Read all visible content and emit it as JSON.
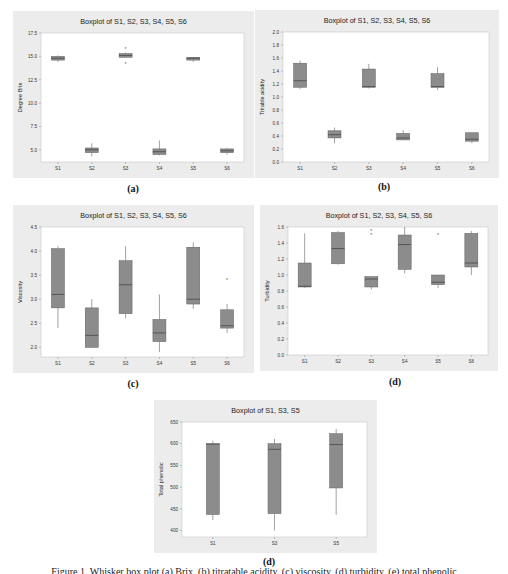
{
  "colors": {
    "frame_bg": "#ececec",
    "plot_bg": "#ffffff",
    "box_fill": "#8c8c8c",
    "box_stroke": "#5f5f5f",
    "axis": "#9a9a9a",
    "text": "#333333"
  },
  "caption": "Figure 1. Whisker box plot (a) Brix, (b) titratable acidity, (c) viscosity, (d) turbidity, (e) total phenolic",
  "chart_data": [
    {
      "id": "a",
      "sublabel": "(a)",
      "type": "box",
      "title": "Boxplot of S1, S2, S3, S4, S5, S6",
      "xlabel": "",
      "ylabel": "Degree Brix",
      "ylim": [
        3.7,
        17.5
      ],
      "yticks": [
        5.0,
        7.5,
        10.0,
        12.5,
        15.0,
        17.5
      ],
      "ytick_labels": [
        "5.0",
        "7.5",
        "10.0",
        "12.5",
        "15.0",
        "17.5"
      ],
      "categories": [
        "S1",
        "S2",
        "S3",
        "S4",
        "S5",
        "S6"
      ],
      "boxes": [
        {
          "min": 14.4,
          "q1": 14.6,
          "median": 14.8,
          "q3": 15.0,
          "max": 15.1,
          "outliers": []
        },
        {
          "min": 4.3,
          "q1": 4.7,
          "median": 5.0,
          "q3": 5.2,
          "max": 5.7,
          "outliers": []
        },
        {
          "min": 14.9,
          "q1": 14.9,
          "median": 15.1,
          "q3": 15.3,
          "max": 15.4,
          "outliers": [
            15.8,
            14.2
          ]
        },
        {
          "min": 4.4,
          "q1": 4.5,
          "median": 4.8,
          "q3": 5.1,
          "max": 6.0,
          "outliers": []
        },
        {
          "min": 14.4,
          "q1": 14.6,
          "median": 14.8,
          "q3": 14.9,
          "max": 14.9,
          "outliers": []
        },
        {
          "min": 4.5,
          "q1": 4.7,
          "median": 4.9,
          "q3": 5.1,
          "max": 5.2,
          "outliers": []
        }
      ]
    },
    {
      "id": "b",
      "sublabel": "(b)",
      "type": "box",
      "title": "Boxplot of S1, S2, S3, S4, S5, S6",
      "xlabel": "",
      "ylabel": "Titrable acidity",
      "ylim": [
        0.0,
        2.0
      ],
      "yticks": [
        0.0,
        0.2,
        0.4,
        0.6,
        0.8,
        1.0,
        1.2,
        1.4,
        1.6,
        1.8,
        2.0
      ],
      "ytick_labels": [
        "0.0",
        "0.2",
        "0.4",
        "0.6",
        "0.8",
        "1.0",
        "1.2",
        "1.4",
        "1.6",
        "1.8",
        "2.0"
      ],
      "categories": [
        "S1",
        "S2",
        "S3",
        "S4",
        "S5",
        "S6"
      ],
      "boxes": [
        {
          "min": 1.12,
          "q1": 1.15,
          "median": 1.25,
          "q3": 1.52,
          "max": 1.56,
          "outliers": []
        },
        {
          "min": 0.29,
          "q1": 0.37,
          "median": 0.42,
          "q3": 0.48,
          "max": 0.53,
          "outliers": []
        },
        {
          "min": 1.13,
          "q1": 1.15,
          "median": 1.16,
          "q3": 1.43,
          "max": 1.51,
          "outliers": []
        },
        {
          "min": 0.34,
          "q1": 0.34,
          "median": 0.37,
          "q3": 0.44,
          "max": 0.49,
          "outliers": []
        },
        {
          "min": 1.11,
          "q1": 1.15,
          "median": 1.16,
          "q3": 1.36,
          "max": 1.46,
          "outliers": []
        },
        {
          "min": 0.29,
          "q1": 0.32,
          "median": 0.35,
          "q3": 0.45,
          "max": 0.45,
          "outliers": []
        }
      ]
    },
    {
      "id": "c",
      "sublabel": "(c)",
      "type": "box",
      "title": "Boxplot of S1, S2, S3, S4, S5, S6",
      "xlabel": "",
      "ylabel": "Viscosity",
      "ylim": [
        1.8,
        4.5
      ],
      "yticks": [
        2.0,
        2.5,
        3.0,
        3.5,
        4.0,
        4.5
      ],
      "ytick_labels": [
        "2.0",
        "2.5",
        "3.0",
        "3.5",
        "4.0",
        "4.5"
      ],
      "categories": [
        "S1",
        "S2",
        "S3",
        "S4",
        "S5",
        "S6"
      ],
      "boxes": [
        {
          "min": 2.4,
          "q1": 2.82,
          "median": 3.1,
          "q3": 4.05,
          "max": 4.1,
          "outliers": []
        },
        {
          "min": 2.0,
          "q1": 2.0,
          "median": 2.25,
          "q3": 2.82,
          "max": 3.0,
          "outliers": []
        },
        {
          "min": 2.6,
          "q1": 2.7,
          "median": 3.3,
          "q3": 3.8,
          "max": 4.1,
          "outliers": []
        },
        {
          "min": 1.9,
          "q1": 2.12,
          "median": 2.3,
          "q3": 2.58,
          "max": 3.1,
          "outliers": []
        },
        {
          "min": 2.8,
          "q1": 2.9,
          "median": 3.0,
          "q3": 4.08,
          "max": 4.18,
          "outliers": []
        },
        {
          "min": 2.3,
          "q1": 2.4,
          "median": 2.45,
          "q3": 2.78,
          "max": 2.9,
          "outliers": [
            3.4
          ]
        }
      ]
    },
    {
      "id": "d",
      "sublabel": "(d)",
      "type": "box",
      "title": "Boxplot of S1, S2, S3, S4, S5, S6",
      "xlabel": "",
      "ylabel": "Turbidity",
      "ylim": [
        0.0,
        1.6
      ],
      "yticks": [
        0.0,
        0.2,
        0.4,
        0.6,
        0.8,
        1.0,
        1.2,
        1.4,
        1.6
      ],
      "ytick_labels": [
        "0.0",
        "0.2",
        "0.4",
        "0.6",
        "0.8",
        "1.0",
        "1.2",
        "1.4",
        "1.6"
      ],
      "categories": [
        "S1",
        "S2",
        "S3",
        "S4",
        "S5",
        "S6"
      ],
      "boxes": [
        {
          "min": 0.84,
          "q1": 0.85,
          "median": 0.86,
          "q3": 1.15,
          "max": 1.52,
          "outliers": []
        },
        {
          "min": 1.13,
          "q1": 1.14,
          "median": 1.33,
          "q3": 1.53,
          "max": 1.55,
          "outliers": []
        },
        {
          "min": 0.82,
          "q1": 0.85,
          "median": 0.95,
          "q3": 0.98,
          "max": 0.98,
          "outliers": [
            1.55,
            1.5
          ]
        },
        {
          "min": 1.02,
          "q1": 1.07,
          "median": 1.38,
          "q3": 1.5,
          "max": 1.6,
          "outliers": []
        },
        {
          "min": 0.84,
          "q1": 0.88,
          "median": 0.91,
          "q3": 1.0,
          "max": 1.0,
          "outliers": [
            1.5
          ]
        },
        {
          "min": 1.0,
          "q1": 1.1,
          "median": 1.15,
          "q3": 1.52,
          "max": 1.55,
          "outliers": []
        }
      ]
    },
    {
      "id": "e",
      "sublabel": "(d)",
      "type": "box",
      "title": "Boxplot of S1, S3, S5",
      "xlabel": "",
      "ylabel": "Total phenolic",
      "ylim": [
        385,
        650
      ],
      "yticks": [
        400,
        450,
        500,
        550,
        600,
        650
      ],
      "ytick_labels": [
        "400",
        "450",
        "500",
        "550",
        "600",
        "650"
      ],
      "categories": [
        "S1",
        "S3",
        "S5"
      ],
      "boxes": [
        {
          "min": 424,
          "q1": 437,
          "median": 599,
          "q3": 600,
          "max": 607,
          "outliers": []
        },
        {
          "min": 400,
          "q1": 439,
          "median": 587,
          "q3": 600,
          "max": 611,
          "outliers": []
        },
        {
          "min": 436,
          "q1": 498,
          "median": 598,
          "q3": 623,
          "max": 634,
          "outliers": []
        }
      ]
    }
  ]
}
